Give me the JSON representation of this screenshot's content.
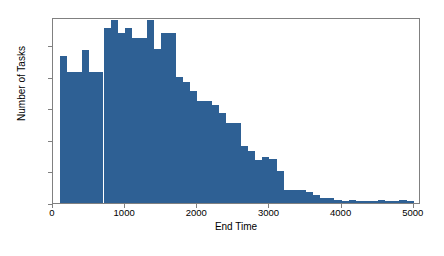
{
  "chart_data": {
    "type": "bar",
    "title": "",
    "xlabel": "End Time",
    "ylabel": "Number of Tasks",
    "xlim": [
      0,
      5100
    ],
    "ylim": [
      0,
      118
    ],
    "grid": false,
    "legend": null,
    "bin_width": 100,
    "bar_color": "#2e6094",
    "xticks": [
      0,
      1000,
      2000,
      3000,
      4000,
      5000
    ],
    "xtick_labels": [
      "0",
      "1000",
      "2000",
      "3000",
      "4000",
      "5000"
    ],
    "yticks": [
      0,
      20,
      40,
      60,
      80,
      100
    ],
    "ytick_labels": [
      "0",
      "20",
      "40",
      "60",
      "80",
      "100"
    ],
    "bin_edges": [
      100,
      200,
      300,
      400,
      500,
      600,
      700,
      800,
      900,
      1000,
      1100,
      1200,
      1300,
      1400,
      1500,
      1600,
      1700,
      1800,
      1900,
      2000,
      2100,
      2200,
      2300,
      2400,
      2500,
      2600,
      2700,
      2800,
      2900,
      3000,
      3100,
      3200,
      3300,
      3400,
      3500,
      3600,
      3700,
      3800,
      3900,
      4000,
      4100,
      4200,
      4300,
      4400,
      4500,
      4600,
      4700,
      4800,
      4900,
      5000
    ],
    "categories": [
      "100",
      "200",
      "300",
      "400",
      "500",
      "600",
      "700",
      "800",
      "900",
      "1000",
      "1100",
      "1200",
      "1300",
      "1400",
      "1500",
      "1600",
      "1700",
      "1800",
      "1900",
      "2000",
      "2100",
      "2200",
      "2300",
      "2400",
      "2500",
      "2600",
      "2700",
      "2800",
      "2900",
      "3000",
      "3100",
      "3200",
      "3300",
      "3400",
      "3500",
      "3600",
      "3700",
      "3800",
      "3900",
      "4000",
      "4100",
      "4200",
      "4300",
      "4400",
      "4500",
      "4600",
      "4700",
      "4800",
      "4900"
    ],
    "values": [
      93,
      83,
      83,
      97,
      83,
      83,
      111,
      116,
      108,
      111,
      105,
      105,
      116,
      98,
      108,
      108,
      80,
      77,
      71,
      65,
      65,
      62,
      57,
      51,
      51,
      36,
      33,
      27,
      29,
      28,
      20,
      8,
      8,
      8,
      7,
      5,
      3,
      3,
      2,
      1,
      2,
      1,
      1,
      1,
      2,
      1,
      1,
      2,
      1
    ]
  },
  "axes": {
    "ylabel": "Number of Tasks",
    "xlabel": "End Time"
  }
}
